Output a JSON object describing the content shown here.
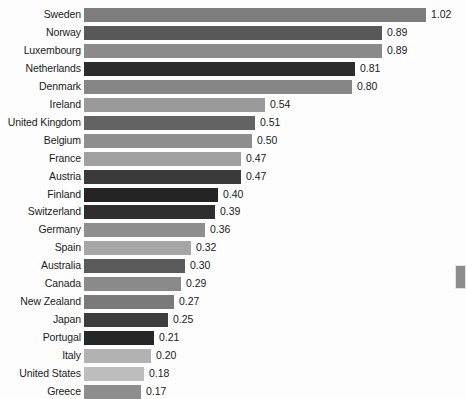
{
  "chart_data": {
    "type": "bar",
    "orientation": "horizontal",
    "title": "",
    "subtitle": "",
    "xlabel": "",
    "ylabel": "",
    "grid": false,
    "legend": null,
    "axis_visible": false,
    "tick_labels": [],
    "xlim": [
      0,
      1.02
    ],
    "value_format": "0.00",
    "categories": [
      "Sweden",
      "Norway",
      "Luxembourg",
      "Netherlands",
      "Denmark",
      "Ireland",
      "United Kingdom",
      "Belgium",
      "France",
      "Austria",
      "Finland",
      "Switzerland",
      "Germany",
      "Spain",
      "Australia",
      "Canada",
      "New Zealand",
      "Japan",
      "Portugal",
      "Italy",
      "United States",
      "Greece"
    ],
    "values": [
      1.02,
      0.89,
      0.89,
      0.81,
      0.8,
      0.54,
      0.51,
      0.5,
      0.47,
      0.47,
      0.4,
      0.39,
      0.36,
      0.32,
      0.3,
      0.29,
      0.27,
      0.25,
      0.21,
      0.2,
      0.18,
      0.17
    ],
    "value_labels": [
      "1.02",
      "0.89",
      "0.89",
      "0.81",
      "0.80",
      "0.54",
      "0.51",
      "0.50",
      "0.47",
      "0.47",
      "0.40",
      "0.39",
      "0.36",
      "0.32",
      "0.30",
      "0.29",
      "0.27",
      "0.25",
      "0.21",
      "0.20",
      "0.18",
      "0.17"
    ],
    "bar_colors": [
      "#7d7d7d",
      "#585858",
      "#8a8a8a",
      "#2c2c2c",
      "#868686",
      "#9a9a9a",
      "#636363",
      "#8e8e8e",
      "#a0a0a0",
      "#3a3a3a",
      "#242424",
      "#2e2e2e",
      "#8e8e8e",
      "#a6a6a6",
      "#5a5a5a",
      "#8a8a8a",
      "#7a7a7a",
      "#3d3d3d",
      "#262626",
      "#b2b2b2",
      "#bdbdbd",
      "#8e8e8e"
    ]
  },
  "marker": {
    "name": "page-edge-marker",
    "color": "#8c8c8c"
  }
}
